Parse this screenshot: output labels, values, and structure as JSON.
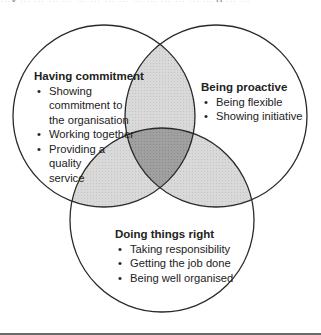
{
  "header": {
    "cut_text": "…y … … … … … … … … … … … … … … g … …"
  },
  "diagram": {
    "type": "venn",
    "colors": {
      "stroke": "#2a2a2a",
      "single": "#ffffff",
      "pair_overlap": "#d4d4d4",
      "triple_overlap": "#9a9a9a",
      "rule": "#6a6a6a"
    },
    "circles": [
      {
        "id": "left",
        "cx": 104,
        "cy": 116,
        "r": 91
      },
      {
        "id": "right",
        "cx": 216,
        "cy": 116,
        "r": 91
      },
      {
        "id": "bottom",
        "cx": 162,
        "cy": 220,
        "r": 92
      }
    ],
    "sets": [
      {
        "title": "Having commitment",
        "items": [
          "Showing commitment to the organisation",
          "Working together",
          "Providing a quality service"
        ],
        "lines": [
          [
            "Showing",
            "commitment to",
            "the organisation"
          ],
          [
            "Working together"
          ],
          [
            "Providing a",
            "quality",
            "service"
          ]
        ]
      },
      {
        "title": "Being proactive",
        "items": [
          "Being flexible",
          "Showing initiative"
        ]
      },
      {
        "title": "Doing things right",
        "items": [
          "Taking responsibility",
          "Getting the job done",
          "Being well organised"
        ]
      }
    ]
  }
}
